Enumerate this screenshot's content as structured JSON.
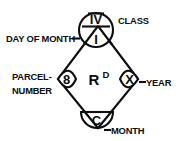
{
  "diagram": {
    "background_color": "#ffffff",
    "ink_color": "#0d0d0d",
    "center_mark": {
      "letter": "R",
      "superscript": "D"
    },
    "marks": {
      "class": "IV",
      "day_of_month": "I",
      "parcel_number": "8",
      "year": "X",
      "month": "C"
    },
    "labels": {
      "class": "CLASS",
      "day_of_month": "DAY OF MONTH",
      "parcel_number_line1": "PARCEL-",
      "parcel_number_line2": "NUMBER",
      "year": "YEAR",
      "month": "MONTH",
      "leader_dash": "-"
    }
  }
}
